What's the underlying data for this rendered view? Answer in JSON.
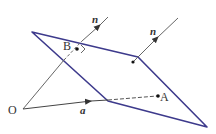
{
  "diagram": {
    "type": "vector-plane-geometry",
    "labels": {
      "origin": "O",
      "point_b": "B",
      "point_a": "A",
      "normal_1": "n",
      "normal_2": "n",
      "vector_a": "a"
    },
    "colors": {
      "plane_edge": "#3d3a8c",
      "lines": "#555555",
      "text": "#333333"
    },
    "elements": [
      "plane (parallelogram)",
      "normal vector n through B",
      "normal vector n on plane",
      "vector a from O",
      "dashed line to A",
      "right-angle mark at B"
    ]
  }
}
